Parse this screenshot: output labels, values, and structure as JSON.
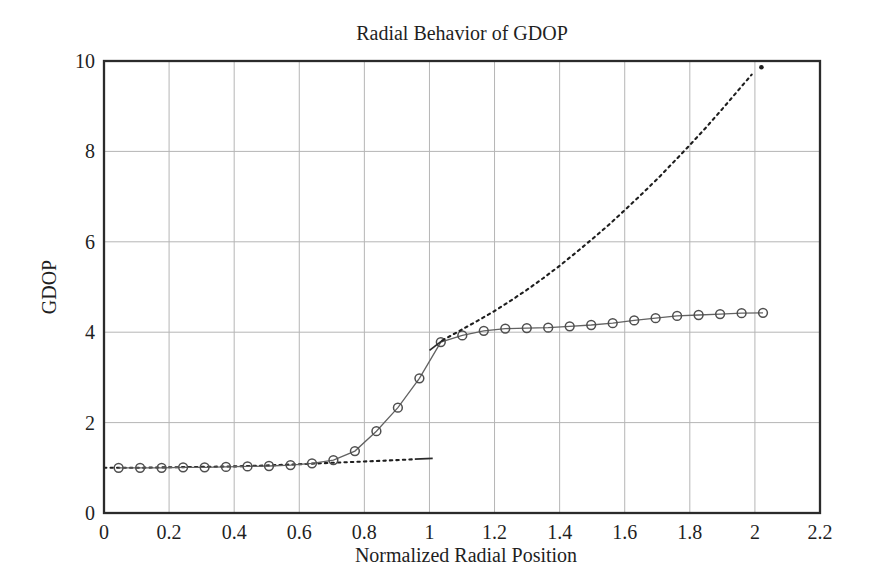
{
  "page": {
    "background": "#ffffff"
  },
  "chart_data": {
    "type": "line",
    "title": "Radial Behavior of GDOP",
    "xlabel": "Normalized Radial Position",
    "ylabel": "GDOP",
    "xlim": [
      0,
      2.2
    ],
    "ylim": [
      0,
      10
    ],
    "grid": true,
    "legend": "none",
    "xticks": [
      {
        "v": 0,
        "label": "0"
      },
      {
        "v": 0.2,
        "label": "0.2"
      },
      {
        "v": 0.4,
        "label": "0.4"
      },
      {
        "v": 0.6,
        "label": "0.6"
      },
      {
        "v": 0.8,
        "label": "0.8"
      },
      {
        "v": 1,
        "label": "1"
      },
      {
        "v": 1.2,
        "label": "1.2"
      },
      {
        "v": 1.4,
        "label": "1.4"
      },
      {
        "v": 1.6,
        "label": "1.6"
      },
      {
        "v": 1.8,
        "label": "1.8"
      },
      {
        "v": 2,
        "label": "2"
      },
      {
        "v": 2.2,
        "label": "2.2"
      }
    ],
    "yticks": [
      {
        "v": 0,
        "label": "0"
      },
      {
        "v": 2,
        "label": "2"
      },
      {
        "v": 4,
        "label": "4"
      },
      {
        "v": 6,
        "label": "6"
      },
      {
        "v": 8,
        "label": "8"
      },
      {
        "v": 10,
        "label": "10"
      }
    ],
    "colors": {
      "background": "#ffffff",
      "text": "#1f1f1f",
      "frame": "#2b2b2b",
      "grid": "#b5b5b5",
      "circle_series": "#626262",
      "dotted_series": "#1e1e1e"
    },
    "series": [
      {
        "id": "gdop-inside-dotted",
        "style": "dotted",
        "color": "#1e1e1e",
        "points": [
          [
            0.0,
            1.0
          ],
          [
            0.1,
            1.0
          ],
          [
            0.2,
            1.01
          ],
          [
            0.3,
            1.02
          ],
          [
            0.4,
            1.03
          ],
          [
            0.5,
            1.05
          ],
          [
            0.6,
            1.08
          ],
          [
            0.7,
            1.11
          ],
          [
            0.8,
            1.14
          ],
          [
            0.9,
            1.17
          ],
          [
            0.955,
            1.19
          ]
        ]
      },
      {
        "id": "gdop-inside-endcap",
        "style": "solid",
        "color": "#2a2a2a",
        "points": [
          [
            0.955,
            1.19
          ],
          [
            1.01,
            1.21
          ]
        ]
      },
      {
        "id": "gdop-circles",
        "style": "line_circles",
        "color": "#626262",
        "marker_color": "#4f4f4f",
        "points": [
          [
            0.045,
            1.0
          ],
          [
            0.111,
            1.0
          ],
          [
            0.177,
            1.0
          ],
          [
            0.243,
            1.01
          ],
          [
            0.309,
            1.01
          ],
          [
            0.375,
            1.02
          ],
          [
            0.441,
            1.03
          ],
          [
            0.507,
            1.04
          ],
          [
            0.573,
            1.06
          ],
          [
            0.639,
            1.1
          ],
          [
            0.705,
            1.17
          ],
          [
            0.771,
            1.37
          ],
          [
            0.837,
            1.81
          ],
          [
            0.903,
            2.33
          ],
          [
            0.969,
            2.98
          ],
          [
            1.035,
            3.78
          ],
          [
            1.101,
            3.93
          ],
          [
            1.167,
            4.03
          ],
          [
            1.233,
            4.08
          ],
          [
            1.299,
            4.09
          ],
          [
            1.365,
            4.1
          ],
          [
            1.431,
            4.13
          ],
          [
            1.497,
            4.16
          ],
          [
            1.563,
            4.2
          ],
          [
            1.629,
            4.26
          ],
          [
            1.695,
            4.31
          ],
          [
            1.761,
            4.36
          ],
          [
            1.827,
            4.38
          ],
          [
            1.893,
            4.4
          ],
          [
            1.959,
            4.42
          ],
          [
            2.025,
            4.43
          ]
        ]
      },
      {
        "id": "gdop-outside-leader",
        "style": "solid",
        "color": "#2a2a2a",
        "points": [
          [
            1.0,
            3.6
          ],
          [
            1.04,
            3.82
          ]
        ]
      },
      {
        "id": "gdop-outside-dotted",
        "style": "dotted",
        "color": "#1e1e1e",
        "points": [
          [
            1.04,
            3.82
          ],
          [
            1.1,
            4.06
          ],
          [
            1.15,
            4.26
          ],
          [
            1.2,
            4.47
          ],
          [
            1.25,
            4.7
          ],
          [
            1.3,
            4.94
          ],
          [
            1.35,
            5.2
          ],
          [
            1.4,
            5.47
          ],
          [
            1.45,
            5.76
          ],
          [
            1.5,
            6.06
          ],
          [
            1.55,
            6.37
          ],
          [
            1.6,
            6.7
          ],
          [
            1.65,
            7.04
          ],
          [
            1.7,
            7.39
          ],
          [
            1.75,
            7.76
          ],
          [
            1.8,
            8.14
          ],
          [
            1.85,
            8.53
          ],
          [
            1.9,
            8.94
          ],
          [
            1.95,
            9.36
          ],
          [
            1.99,
            9.7
          ]
        ]
      },
      {
        "id": "gdop-isolated-dot",
        "style": "dot",
        "color": "#1e1e1e",
        "points": [
          [
            2.02,
            9.86
          ]
        ]
      }
    ]
  }
}
